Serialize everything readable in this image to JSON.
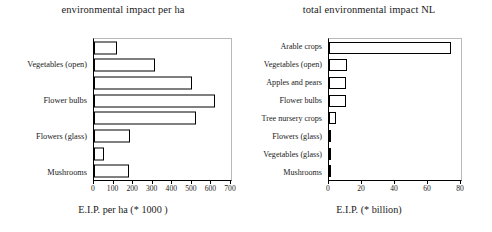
{
  "chart_data": [
    {
      "type": "bar",
      "orientation": "horizontal",
      "title": "environmental impact per ha",
      "xlabel": "E.I.P. per ha (* 1000 )",
      "ylabel": "",
      "xlim": [
        0,
        700
      ],
      "xticks": [
        0,
        100,
        200,
        300,
        400,
        500,
        600,
        700
      ],
      "xticklabels": [
        "0",
        "100",
        "200",
        "300",
        "400",
        "500",
        "600",
        "700"
      ],
      "grid": false,
      "legend": false,
      "categories": [
        "",
        "Vegetables (open)",
        "",
        "Flower bulbs",
        "",
        "Flowers (glass)",
        "",
        "Mushrooms"
      ],
      "visible_ticklabels": [
        "",
        "Vegetables (open)",
        "",
        "Flower bulbs",
        "",
        "Flowers (glass)",
        "",
        "Mushrooms"
      ],
      "values": [
        120,
        310,
        500,
        620,
        520,
        185,
        50,
        180
      ]
    },
    {
      "type": "bar",
      "orientation": "horizontal",
      "title": "total environmental impact NL",
      "xlabel": "E.I.P. (* billion)",
      "ylabel": "",
      "xlim": [
        0,
        80
      ],
      "xticks": [
        0,
        20,
        40,
        60,
        80
      ],
      "xticklabels": [
        "0",
        "20",
        "40",
        "60",
        "80"
      ],
      "grid": false,
      "legend": false,
      "categories": [
        "Arable crops",
        "Vegetables (open)",
        "Apples and pears",
        "Flower bulbs",
        "Tree nursery crops",
        "Flowers (glass)",
        "Vegetables (glass)",
        "Mushrooms"
      ],
      "values": [
        74,
        11,
        10.5,
        10,
        4,
        0.7,
        0.4,
        0.1
      ]
    }
  ]
}
